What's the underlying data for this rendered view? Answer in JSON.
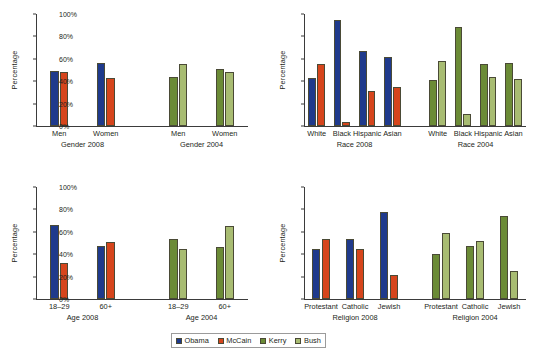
{
  "legend": {
    "items": [
      {
        "label": "Obama",
        "color": "#1F3A8C"
      },
      {
        "label": "McCain",
        "color": "#D6451C"
      },
      {
        "label": "Kerry",
        "color": "#6B8B36"
      },
      {
        "label": "Bush",
        "color": "#A8BC72"
      }
    ]
  },
  "axis": {
    "ylabel": "Percentage",
    "ticks": [
      "0%",
      "20%",
      "40%",
      "60%",
      "80%",
      "100%"
    ],
    "tick_values": [
      0,
      20,
      40,
      60,
      80,
      100
    ]
  },
  "chart_data": [
    {
      "id": "gender",
      "type": "bar",
      "title": "",
      "xlabel": "",
      "ylabel": "Percentage",
      "ylim": [
        0,
        100
      ],
      "grid": false,
      "legend_position": "bottom-center-shared",
      "groups": [
        {
          "group_label": "Gender 2008",
          "categories": [
            "Men",
            "Women"
          ],
          "series": [
            {
              "name": "Obama",
              "color": "#1F3A8C",
              "values": [
                49,
                56
              ]
            },
            {
              "name": "McCain",
              "color": "#D6451C",
              "values": [
                48,
                43
              ]
            }
          ]
        },
        {
          "group_label": "Gender 2004",
          "categories": [
            "Men",
            "Women"
          ],
          "series": [
            {
              "name": "Kerry",
              "color": "#6B8B36",
              "values": [
                44,
                51
              ]
            },
            {
              "name": "Bush",
              "color": "#A8BC72",
              "values": [
                55,
                48
              ]
            }
          ]
        }
      ]
    },
    {
      "id": "race",
      "type": "bar",
      "title": "",
      "xlabel": "",
      "ylabel": "Percentage",
      "ylim": [
        0,
        100
      ],
      "grid": false,
      "legend_position": "bottom-center-shared",
      "groups": [
        {
          "group_label": "Race 2008",
          "categories": [
            "White",
            "Black",
            "Hispanic",
            "Asian"
          ],
          "series": [
            {
              "name": "Obama",
              "color": "#1F3A8C",
              "values": [
                43,
                95,
                67,
                62
              ]
            },
            {
              "name": "McCain",
              "color": "#D6451C",
              "values": [
                55,
                4,
                31,
                35
              ]
            }
          ]
        },
        {
          "group_label": "Race 2004",
          "categories": [
            "White",
            "Black",
            "Hispanic",
            "Asian"
          ],
          "series": [
            {
              "name": "Kerry",
              "color": "#6B8B36",
              "values": [
                41,
                88,
                55,
                56
              ]
            },
            {
              "name": "Bush",
              "color": "#A8BC72",
              "values": [
                58,
                11,
                44,
                42
              ]
            }
          ]
        }
      ]
    },
    {
      "id": "age",
      "type": "bar",
      "title": "",
      "xlabel": "",
      "ylabel": "Percentage",
      "ylim": [
        0,
        100
      ],
      "grid": false,
      "legend_position": "bottom-center-shared",
      "groups": [
        {
          "group_label": "Age 2008",
          "categories": [
            "18–29",
            "60+"
          ],
          "series": [
            {
              "name": "Obama",
              "color": "#1F3A8C",
              "values": [
                66,
                47
              ]
            },
            {
              "name": "McCain",
              "color": "#D6451C",
              "values": [
                32,
                51
              ]
            }
          ]
        },
        {
          "group_label": "Age 2004",
          "categories": [
            "18–29",
            "60+"
          ],
          "series": [
            {
              "name": "Kerry",
              "color": "#6B8B36",
              "values": [
                54,
                46
              ]
            },
            {
              "name": "Bush",
              "color": "#A8BC72",
              "values": [
                45,
                65
              ]
            }
          ]
        }
      ]
    },
    {
      "id": "religion",
      "type": "bar",
      "title": "",
      "xlabel": "",
      "ylabel": "Percentage",
      "ylim": [
        0,
        100
      ],
      "grid": false,
      "legend_position": "bottom-center-shared",
      "groups": [
        {
          "group_label": "Religion 2008",
          "categories": [
            "Protestant",
            "Catholic",
            "Jewish"
          ],
          "series": [
            {
              "name": "Obama",
              "color": "#1F3A8C",
              "values": [
                45,
                54,
                78
              ]
            },
            {
              "name": "McCain",
              "color": "#D6451C",
              "values": [
                54,
                45,
                21
              ]
            }
          ]
        },
        {
          "group_label": "Religion 2004",
          "categories": [
            "Protestant",
            "Catholic",
            "Jewish"
          ],
          "series": [
            {
              "name": "Kerry",
              "color": "#6B8B36",
              "values": [
                40,
                47,
                74
              ]
            },
            {
              "name": "Bush",
              "color": "#A8BC72",
              "values": [
                59,
                52,
                25
              ]
            }
          ]
        }
      ]
    }
  ]
}
